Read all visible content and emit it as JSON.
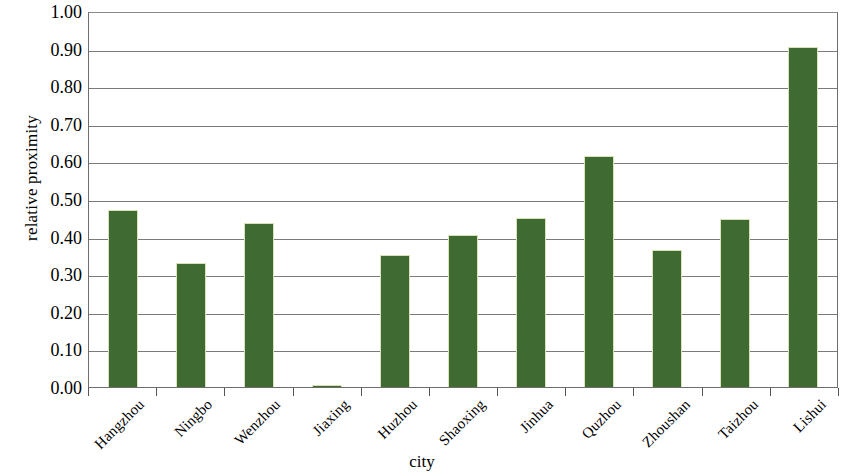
{
  "chart_data": {
    "type": "bar",
    "title": "",
    "xlabel": "city",
    "ylabel": "relative proximity",
    "categories": [
      "Hangzhou",
      "Ningbo",
      "Wenzhou",
      "Jiaxing",
      "Huzhou",
      "Shaoxing",
      "Jinhua",
      "Quzhou",
      "Zhoushan",
      "Taizhou",
      "Lishui"
    ],
    "values": [
      0.47,
      0.33,
      0.435,
      0.005,
      0.35,
      0.405,
      0.45,
      0.615,
      0.365,
      0.448,
      0.905
    ],
    "series": [
      {
        "name": "relative proximity",
        "values": [
          0.47,
          0.33,
          0.435,
          0.005,
          0.35,
          0.405,
          0.45,
          0.615,
          0.365,
          0.448,
          0.905
        ]
      }
    ],
    "ylim": [
      0.0,
      1.0
    ],
    "ytick_step": 0.1,
    "ytick_labels": [
      "0.00",
      "0.10",
      "0.20",
      "0.30",
      "0.40",
      "0.50",
      "0.60",
      "0.70",
      "0.80",
      "0.90",
      "1.00"
    ],
    "ytick_values": [
      0.0,
      0.1,
      0.2,
      0.3,
      0.4,
      0.5,
      0.6,
      0.7,
      0.8,
      0.9,
      1.0
    ],
    "grid": true,
    "grid_axis": "y",
    "legend": false,
    "legend_position": "none",
    "bar_color": "#3f6b33",
    "bar_edge_color": "#d9e2b8",
    "plot_border_color": "#6e6e6e",
    "gridline_color": "#7a7a7a",
    "background_color": "#ffffff",
    "xtick_label_rotation": -45
  }
}
